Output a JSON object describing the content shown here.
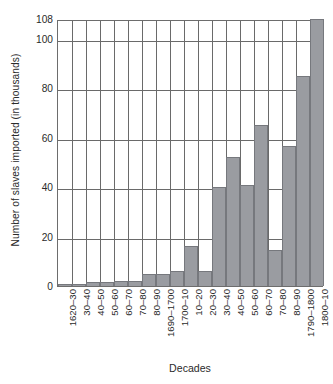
{
  "chart_data": {
    "type": "bar",
    "title": "",
    "xlabel": "Decades",
    "ylabel": "Number of slaves imported (in thousands)",
    "categories": [
      "1620–30",
      "30–40",
      "40–50",
      "50–60",
      "60–70",
      "70–80",
      "80–90",
      "1690–1700",
      "1700–10",
      "10–20",
      "20–30",
      "30–40",
      "40–50",
      "50–60",
      "60–70",
      "70–80",
      "80–90",
      "1790–1800",
      "1800–10"
    ],
    "values": [
      1,
      1,
      1.5,
      1.5,
      2,
      2,
      5,
      5,
      6,
      16,
      6,
      40,
      52,
      41,
      65,
      14.5,
      56.5,
      85,
      108
    ],
    "ylim": [
      0,
      108
    ],
    "yticks": [
      0,
      20,
      40,
      60,
      80,
      100,
      108
    ],
    "ytick_labels": [
      "0",
      "20",
      "40",
      "60",
      "80",
      "100",
      "108"
    ],
    "grid": "horizontal-and-vertical",
    "legend": "none",
    "bar_color": "#9a9ca1",
    "bar_edge_color": "#76787d",
    "axis_color": "#6a6a6a",
    "background": "#ffffff"
  }
}
